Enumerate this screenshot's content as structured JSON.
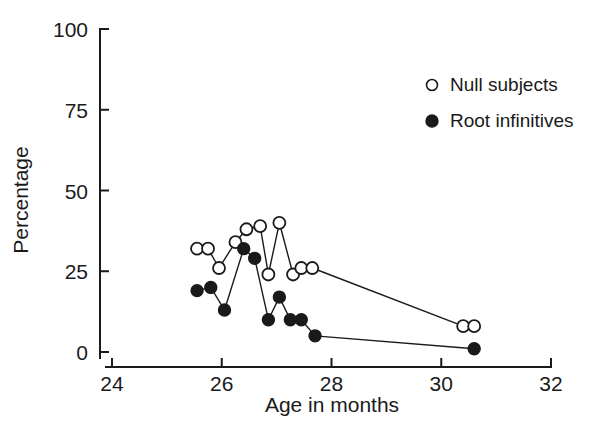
{
  "chart_data": {
    "type": "scatter",
    "title": "",
    "xlabel": "Age in months",
    "ylabel": "Percentage",
    "xlim": [
      24,
      32
    ],
    "ylim": [
      0,
      100
    ],
    "xticks": [
      24,
      26,
      28,
      30,
      32
    ],
    "yticks": [
      0,
      25,
      50,
      75,
      100
    ],
    "grid": false,
    "legend_position": "top-right",
    "series": [
      {
        "name": "Null subjects",
        "marker": "open-circle",
        "color": "#1a1a1a",
        "points": [
          {
            "x": 25.55,
            "y": 32
          },
          {
            "x": 25.75,
            "y": 32
          },
          {
            "x": 25.95,
            "y": 26
          },
          {
            "x": 26.25,
            "y": 34
          },
          {
            "x": 26.45,
            "y": 38
          },
          {
            "x": 26.7,
            "y": 39
          },
          {
            "x": 26.85,
            "y": 24
          },
          {
            "x": 27.05,
            "y": 40
          },
          {
            "x": 27.3,
            "y": 24
          },
          {
            "x": 27.45,
            "y": 26
          },
          {
            "x": 27.65,
            "y": 26
          },
          {
            "x": 30.4,
            "y": 8
          },
          {
            "x": 30.6,
            "y": 8
          }
        ]
      },
      {
        "name": "Root infinitives",
        "marker": "filled-circle",
        "color": "#1a1a1a",
        "points": [
          {
            "x": 25.55,
            "y": 19
          },
          {
            "x": 25.8,
            "y": 20
          },
          {
            "x": 26.05,
            "y": 13
          },
          {
            "x": 26.4,
            "y": 32
          },
          {
            "x": 26.6,
            "y": 29
          },
          {
            "x": 26.85,
            "y": 10
          },
          {
            "x": 27.05,
            "y": 17
          },
          {
            "x": 27.25,
            "y": 10
          },
          {
            "x": 27.45,
            "y": 10
          },
          {
            "x": 27.7,
            "y": 5
          },
          {
            "x": 30.6,
            "y": 1
          }
        ]
      }
    ]
  },
  "legend": {
    "items": [
      {
        "label": "Null subjects",
        "marker": "open-circle"
      },
      {
        "label": "Root infinitives",
        "marker": "filled-circle"
      }
    ]
  }
}
